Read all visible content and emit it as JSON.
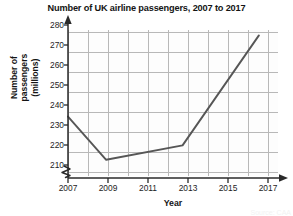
{
  "chart_data": {
    "type": "line",
    "title": "Number of UK airline passengers, 2007 to 2017",
    "xlabel": "Year",
    "ylabel_lines": [
      "Number of",
      "passengers",
      "(millions)"
    ],
    "ylabel": "Number of passengers (millions)",
    "x": [
      2007,
      2009,
      2013,
      2017
    ],
    "values": [
      240,
      216,
      224,
      285
    ],
    "series": [
      {
        "name": "UK airline passengers",
        "points": [
          {
            "x": 2007,
            "y": 240
          },
          {
            "x": 2009,
            "y": 216
          },
          {
            "x": 2013,
            "y": 224
          },
          {
            "x": 2017,
            "y": 285
          }
        ]
      }
    ],
    "xticks": [
      "2007",
      "2009",
      "2011",
      "2013",
      "2015",
      "2017"
    ],
    "yticks": [
      "210",
      "220",
      "230",
      "240",
      "250",
      "260",
      "270",
      "280"
    ],
    "xlim": [
      2007,
      2018
    ],
    "ylim": [
      207,
      288
    ],
    "y_axis_break": true,
    "grid": true,
    "legend": "none",
    "line_color": "#565656",
    "grid_major_color": "#b8b8b8",
    "grid_minor_color": "#e4e4e4",
    "axis_color": "#2a2a2a"
  },
  "source_note": "Source: CAA"
}
